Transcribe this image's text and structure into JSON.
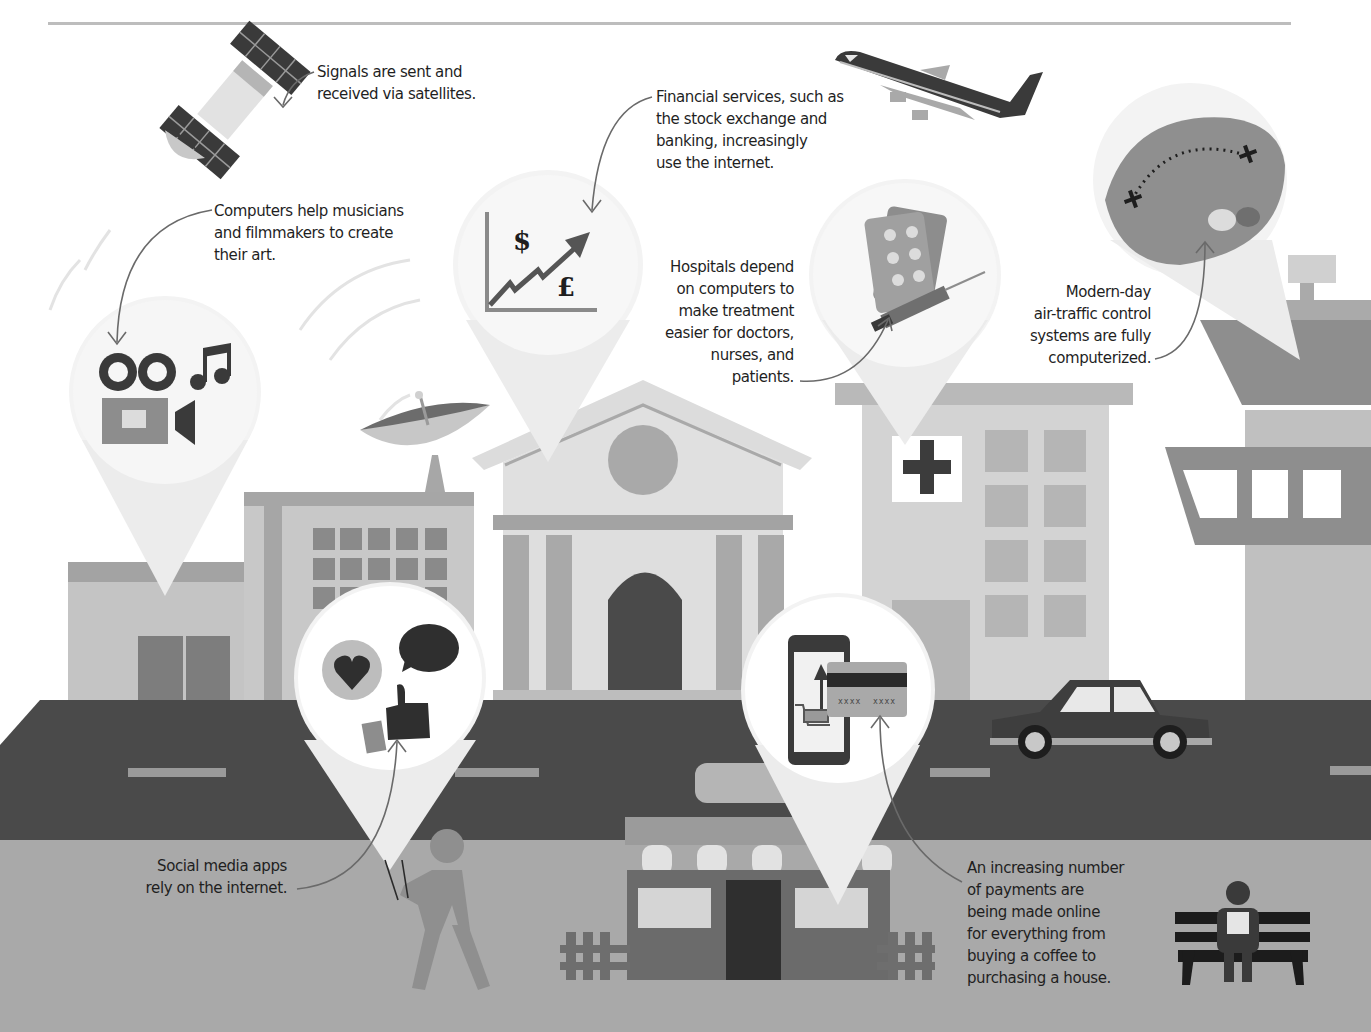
{
  "captions": {
    "satellites": {
      "lines": [
        "Signals are sent and",
        "received via satellites."
      ]
    },
    "finance": {
      "lines": [
        "Financial services, such as",
        "the stock exchange and",
        "banking, increasingly",
        "use the internet."
      ]
    },
    "arts": {
      "lines": [
        "Computers help musicians",
        "and filmmakers to create",
        "their art."
      ]
    },
    "hospitals": {
      "lines": [
        "Hospitals depend",
        "on computers to",
        "make treatment",
        "easier for doctors,",
        "nurses, and",
        "patients."
      ]
    },
    "air_traffic": {
      "lines": [
        "Modern-day",
        "air-traffic control",
        "systems are fully",
        "computerized."
      ]
    },
    "social": {
      "lines": [
        "Social media apps",
        "rely on the internet."
      ]
    },
    "payments": {
      "lines": [
        "An increasing number",
        "of payments are",
        "being made online",
        "for everything from",
        "buying a coffee to",
        "purchasing a house."
      ]
    }
  },
  "icons": {
    "finance_symbols": {
      "dollar": "$",
      "pound": "£"
    },
    "card_number": "xxxx  xxxx"
  },
  "colors": {
    "sky": "#ffffff",
    "road": "#4a4a4a",
    "sidewalk": "#a9a9a9",
    "building_light": "#cfcfcf",
    "building_mid": "#b4b4b4",
    "building_dark": "#8f8f8f",
    "icon_dark": "#3a3a3a",
    "pin": "#f4f4f4",
    "text": "#1f1f1f"
  }
}
